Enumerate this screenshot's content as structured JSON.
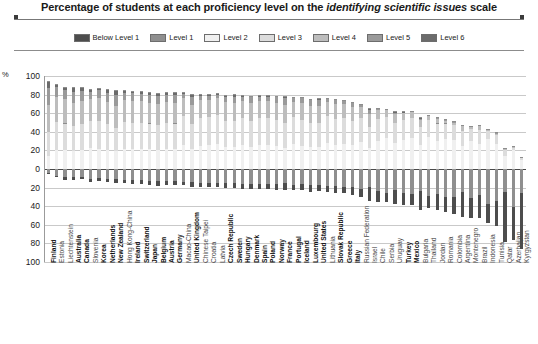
{
  "title": {
    "pre": "Percentage of students at each proficiency level on the ",
    "italic": "identifying scientific issues",
    "post": " scale"
  },
  "legend": {
    "items": [
      {
        "label": "Below Level 1",
        "color": "#4d4d4d"
      },
      {
        "label": "Level 1",
        "color": "#8f8f8f"
      },
      {
        "label": "Level 2",
        "color": "#f0f0f0"
      },
      {
        "label": "Level 3",
        "color": "#dcdcdc"
      },
      {
        "label": "Level 4",
        "color": "#bdbdbd"
      },
      {
        "label": "Level 5",
        "color": "#9a9a9a"
      },
      {
        "label": "Level 6",
        "color": "#6b6b6b"
      }
    ]
  },
  "axis": {
    "unit": "%",
    "ticks_above": [
      "100",
      "80",
      "60",
      "40",
      "20",
      "0"
    ],
    "ticks_below": [
      "20",
      "40",
      "60",
      "80",
      "100"
    ]
  },
  "chart_data": {
    "type": "bar",
    "title": "Percentage of students at each proficiency level on the identifying scientific issues scale",
    "xlabel": "",
    "ylabel": "%",
    "ylim": [
      -100,
      100
    ],
    "grid": true,
    "legend_position": "top-center",
    "stacked": true,
    "orientation": "vertical-diverging",
    "note": "Levels 2-6 stack upward from zero; Below Level 1 and Level 1 stack downward from zero.",
    "series": [
      {
        "name": "Below Level 1",
        "color": "#4d4d4d",
        "direction": "down"
      },
      {
        "name": "Level 1",
        "color": "#8f8f8f",
        "direction": "down"
      },
      {
        "name": "Level 2",
        "color": "#f0f0f0",
        "direction": "up"
      },
      {
        "name": "Level 3",
        "color": "#dcdcdc",
        "direction": "up"
      },
      {
        "name": "Level 4",
        "color": "#bdbdbd",
        "direction": "up"
      },
      {
        "name": "Level 5",
        "color": "#9a9a9a",
        "direction": "up"
      },
      {
        "name": "Level 6",
        "color": "#6b6b6b",
        "direction": "up"
      }
    ],
    "categories": [
      "Finland",
      "Estonia",
      "Liechtenstein",
      "Australia",
      "Canada",
      "Slovenia",
      "Korea",
      "Netherlands",
      "New Zealand",
      "Hong Kong-China",
      "Ireland",
      "Switzerland",
      "Japan",
      "Belgium",
      "Austria",
      "Germany",
      "Macao-China",
      "United Kingdom",
      "Chinese Taipei",
      "Croatia",
      "Latvia",
      "Czech Republic",
      "Sweden",
      "Hungary",
      "Denmark",
      "Spain",
      "Poland",
      "Norway",
      "France",
      "Portugal",
      "Iceland",
      "Luxembourg",
      "United States",
      "Lithuania",
      "Slovak Republic",
      "Greece",
      "Italy",
      "Russian Federation",
      "Israel",
      "Chile",
      "Serbia",
      "Uruguay",
      "Turkey",
      "Mexico",
      "Bulgaria",
      "Thailand",
      "Jordan",
      "Romania",
      "Colombia",
      "Argentina",
      "Montenegro",
      "Brazil",
      "Indonesia",
      "Tunisia",
      "Qatar",
      "Azerbaijan",
      "Kyrgyzstan"
    ],
    "bold_categories": [
      "Finland",
      "Australia",
      "Canada",
      "Korea",
      "Netherlands",
      "New Zealand",
      "Ireland",
      "Switzerland",
      "Japan",
      "Belgium",
      "Austria",
      "Germany",
      "United Kingdom",
      "Czech Republic",
      "Sweden",
      "Hungary",
      "Denmark",
      "Spain",
      "Poland",
      "Norway",
      "France",
      "Portugal",
      "Iceland",
      "Luxembourg",
      "United States",
      "Slovak Republic",
      "Greece",
      "Italy",
      "Turkey",
      "Mexico"
    ],
    "data": [
      {
        "c": "Finland",
        "bl1": 1.3,
        "l1": 4.0,
        "l2": 15.0,
        "l3": 26.0,
        "l4": 29.0,
        "l5": 18.0,
        "l6": 6.7
      },
      {
        "c": "Estonia",
        "bl1": 1.7,
        "l1": 7.0,
        "l2": 21.0,
        "l3": 31.0,
        "l4": 27.0,
        "l5": 10.0,
        "l6": 2.3
      },
      {
        "c": "Liechtenstein",
        "bl1": 2.7,
        "l1": 9.0,
        "l2": 21.0,
        "l3": 29.0,
        "l4": 26.0,
        "l5": 10.0,
        "l6": 2.3
      },
      {
        "c": "Australia",
        "bl1": 3.0,
        "l1": 9.0,
        "l2": 20.0,
        "l3": 27.0,
        "l4": 25.0,
        "l5": 12.0,
        "l6": 4.0
      },
      {
        "c": "Canada",
        "bl1": 2.3,
        "l1": 9.0,
        "l2": 21.0,
        "l3": 28.0,
        "l4": 25.0,
        "l5": 11.0,
        "l6": 3.7
      },
      {
        "c": "Slovenia",
        "bl1": 3.0,
        "l1": 11.0,
        "l2": 24.0,
        "l3": 29.0,
        "l4": 23.0,
        "l5": 8.0,
        "l6": 2.0
      },
      {
        "c": "Korea",
        "bl1": 2.4,
        "l1": 10.0,
        "l2": 23.0,
        "l3": 30.0,
        "l4": 24.0,
        "l5": 9.0,
        "l6": 1.6
      },
      {
        "c": "Netherlands",
        "bl1": 3.1,
        "l1": 11.0,
        "l2": 22.0,
        "l3": 27.0,
        "l4": 24.0,
        "l5": 10.0,
        "l6": 2.9
      },
      {
        "c": "New Zealand",
        "bl1": 4.2,
        "l1": 11.0,
        "l2": 20.0,
        "l3": 25.0,
        "l4": 24.0,
        "l5": 12.0,
        "l6": 3.8
      },
      {
        "c": "Hong Kong-China",
        "bl1": 3.3,
        "l1": 12.0,
        "l2": 23.0,
        "l3": 29.0,
        "l4": 23.0,
        "l5": 8.0,
        "l6": 1.7
      },
      {
        "c": "Ireland",
        "bl1": 3.6,
        "l1": 12.0,
        "l2": 23.0,
        "l3": 28.0,
        "l4": 23.0,
        "l5": 9.0,
        "l6": 1.4
      },
      {
        "c": "Switzerland",
        "bl1": 4.0,
        "l1": 12.0,
        "l2": 23.0,
        "l3": 28.0,
        "l4": 23.0,
        "l5": 8.0,
        "l6": 2.0
      },
      {
        "c": "Japan",
        "bl1": 4.1,
        "l1": 13.0,
        "l2": 23.0,
        "l3": 27.0,
        "l4": 22.0,
        "l5": 9.0,
        "l6": 1.9
      },
      {
        "c": "Belgium",
        "bl1": 5.0,
        "l1": 13.0,
        "l2": 22.0,
        "l3": 26.0,
        "l4": 23.0,
        "l5": 9.0,
        "l6": 2.0
      },
      {
        "c": "Austria",
        "bl1": 4.6,
        "l1": 13.0,
        "l2": 23.0,
        "l3": 28.0,
        "l4": 22.0,
        "l5": 8.0,
        "l6": 1.4
      },
      {
        "c": "Germany",
        "bl1": 4.5,
        "l1": 13.0,
        "l2": 23.0,
        "l3": 27.0,
        "l4": 22.0,
        "l5": 9.0,
        "l6": 1.5
      },
      {
        "c": "Macao-China",
        "bl1": 3.4,
        "l1": 14.0,
        "l2": 27.0,
        "l3": 31.0,
        "l4": 19.0,
        "l5": 5.0,
        "l6": 0.6
      },
      {
        "c": "United Kingdom",
        "bl1": 5.2,
        "l1": 14.0,
        "l2": 23.0,
        "l3": 26.0,
        "l4": 21.0,
        "l5": 9.0,
        "l6": 1.8
      },
      {
        "c": "Chinese Taipei",
        "bl1": 4.1,
        "l1": 15.0,
        "l2": 26.0,
        "l3": 30.0,
        "l4": 19.0,
        "l5": 5.0,
        "l6": 0.9
      },
      {
        "c": "Croatia",
        "bl1": 4.3,
        "l1": 15.0,
        "l2": 27.0,
        "l3": 30.0,
        "l4": 18.0,
        "l5": 5.0,
        "l6": 0.7
      },
      {
        "c": "Latvia",
        "bl1": 4.1,
        "l1": 15.0,
        "l2": 28.0,
        "l3": 31.0,
        "l4": 18.0,
        "l5": 4.0,
        "l6": 0.4
      },
      {
        "c": "Czech Republic",
        "bl1": 5.7,
        "l1": 15.0,
        "l2": 25.0,
        "l3": 28.0,
        "l4": 20.0,
        "l5": 6.0,
        "l6": 1.0
      },
      {
        "c": "Sweden",
        "bl1": 5.6,
        "l1": 15.0,
        "l2": 25.0,
        "l3": 28.0,
        "l4": 19.0,
        "l5": 7.0,
        "l6": 1.3
      },
      {
        "c": "Hungary",
        "bl1": 5.0,
        "l1": 16.0,
        "l2": 27.0,
        "l3": 29.0,
        "l4": 18.0,
        "l5": 5.0,
        "l6": 0.6
      },
      {
        "c": "Denmark",
        "bl1": 6.0,
        "l1": 16.0,
        "l2": 25.0,
        "l3": 28.0,
        "l4": 19.0,
        "l5": 6.0,
        "l6": 1.0
      },
      {
        "c": "Spain",
        "bl1": 5.6,
        "l1": 16.0,
        "l2": 27.0,
        "l3": 29.0,
        "l4": 18.0,
        "l5": 5.0,
        "l6": 0.6
      },
      {
        "c": "Poland",
        "bl1": 5.5,
        "l1": 16.0,
        "l2": 27.0,
        "l3": 29.0,
        "l4": 18.0,
        "l5": 5.0,
        "l6": 0.6
      },
      {
        "c": "Norway",
        "bl1": 6.3,
        "l1": 16.0,
        "l2": 26.0,
        "l3": 28.0,
        "l4": 18.0,
        "l5": 6.0,
        "l6": 0.9
      },
      {
        "c": "France",
        "bl1": 7.1,
        "l1": 15.0,
        "l2": 24.0,
        "l3": 27.0,
        "l4": 19.0,
        "l5": 7.0,
        "l6": 1.3
      },
      {
        "c": "Portugal",
        "bl1": 5.5,
        "l1": 17.0,
        "l2": 28.0,
        "l3": 29.0,
        "l4": 16.0,
        "l5": 4.0,
        "l6": 0.4
      },
      {
        "c": "Iceland",
        "bl1": 7.0,
        "l1": 16.0,
        "l2": 26.0,
        "l3": 28.0,
        "l4": 18.0,
        "l5": 5.0,
        "l6": 0.7
      },
      {
        "c": "Luxembourg",
        "bl1": 7.4,
        "l1": 17.0,
        "l2": 25.0,
        "l3": 26.0,
        "l4": 18.0,
        "l5": 6.0,
        "l6": 0.8
      },
      {
        "c": "United States",
        "bl1": 7.0,
        "l1": 17.0,
        "l2": 25.0,
        "l3": 26.0,
        "l4": 18.0,
        "l5": 6.0,
        "l6": 1.2
      },
      {
        "c": "Lithuania",
        "bl1": 6.5,
        "l1": 18.0,
        "l2": 29.0,
        "l3": 29.0,
        "l4": 15.0,
        "l5": 3.0,
        "l6": 0.3
      },
      {
        "c": "Slovak Republic",
        "bl1": 7.5,
        "l1": 18.0,
        "l2": 27.0,
        "l3": 28.0,
        "l4": 16.0,
        "l5": 4.0,
        "l6": 0.4
      },
      {
        "c": "Greece",
        "bl1": 7.2,
        "l1": 19.0,
        "l2": 28.0,
        "l3": 28.0,
        "l4": 15.0,
        "l5": 3.0,
        "l6": 0.3
      },
      {
        "c": "Italy",
        "bl1": 8.5,
        "l1": 19.0,
        "l2": 27.0,
        "l3": 26.0,
        "l4": 15.0,
        "l5": 4.0,
        "l6": 0.5
      },
      {
        "c": "Russian Federation",
        "bl1": 8.0,
        "l1": 22.0,
        "l2": 30.0,
        "l3": 26.0,
        "l4": 12.0,
        "l5": 2.0,
        "l6": 0.2
      },
      {
        "c": "Israel",
        "bl1": 15.0,
        "l1": 19.0,
        "l2": 24.0,
        "l3": 22.0,
        "l4": 14.0,
        "l5": 5.0,
        "l6": 0.9
      },
      {
        "c": "Chile",
        "bl1": 11.0,
        "l1": 24.0,
        "l2": 31.0,
        "l3": 24.0,
        "l4": 9.0,
        "l5": 1.5,
        "l6": 0.1
      },
      {
        "c": "Serbia",
        "bl1": 10.0,
        "l1": 26.0,
        "l2": 34.0,
        "l3": 23.0,
        "l4": 7.0,
        "l5": 0.8,
        "l6": 0.1
      },
      {
        "c": "Uruguay",
        "bl1": 15.0,
        "l1": 23.0,
        "l2": 29.0,
        "l3": 22.0,
        "l4": 9.0,
        "l5": 1.8,
        "l6": 0.2
      },
      {
        "c": "Turkey",
        "bl1": 13.0,
        "l1": 26.0,
        "l2": 32.0,
        "l3": 22.0,
        "l4": 7.0,
        "l5": 0.9,
        "l6": 0.1
      },
      {
        "c": "Mexico",
        "bl1": 12.0,
        "l1": 27.0,
        "l2": 34.0,
        "l3": 22.0,
        "l4": 6.0,
        "l5": 0.5,
        "l6": 0.1
      },
      {
        "c": "Bulgaria",
        "bl1": 20.0,
        "l1": 24.0,
        "l2": 27.0,
        "l3": 19.0,
        "l4": 8.0,
        "l5": 1.5,
        "l6": 0.2
      },
      {
        "c": "Thailand",
        "bl1": 13.0,
        "l1": 29.0,
        "l2": 35.0,
        "l3": 19.0,
        "l4": 4.0,
        "l5": 0.3,
        "l6": 0.0
      },
      {
        "c": "Jordan",
        "bl1": 17.0,
        "l1": 27.0,
        "l2": 31.0,
        "l3": 19.0,
        "l4": 5.0,
        "l5": 0.7,
        "l6": 0.1
      },
      {
        "c": "Romania",
        "bl1": 16.0,
        "l1": 30.0,
        "l2": 33.0,
        "l3": 17.0,
        "l4": 3.0,
        "l5": 0.3,
        "l6": 0.0
      },
      {
        "c": "Colombia",
        "bl1": 18.0,
        "l1": 30.0,
        "l2": 32.0,
        "l3": 16.0,
        "l4": 3.0,
        "l5": 0.3,
        "l6": 0.0
      },
      {
        "c": "Argentina",
        "bl1": 27.0,
        "l1": 25.0,
        "l2": 26.0,
        "l3": 16.0,
        "l4": 5.0,
        "l5": 0.6,
        "l6": 0.1
      },
      {
        "c": "Montenegro",
        "bl1": 22.0,
        "l1": 31.0,
        "l2": 31.0,
        "l3": 13.0,
        "l4": 2.0,
        "l5": 0.2,
        "l6": 0.0
      },
      {
        "c": "Brazil",
        "bl1": 25.0,
        "l1": 28.0,
        "l2": 28.0,
        "l3": 15.0,
        "l4": 4.0,
        "l5": 0.4,
        "l6": 0.0
      },
      {
        "c": "Indonesia",
        "bl1": 20.0,
        "l1": 38.0,
        "l2": 33.0,
        "l3": 9.0,
        "l4": 0.8,
        "l5": 0.0,
        "l6": 0.0
      },
      {
        "c": "Tunisia",
        "bl1": 27.0,
        "l1": 34.0,
        "l2": 28.0,
        "l3": 10.0,
        "l4": 1.3,
        "l5": 0.1,
        "l6": 0.0
      },
      {
        "c": "Qatar",
        "bl1": 53.0,
        "l1": 25.0,
        "l2": 15.0,
        "l3": 6.0,
        "l4": 1.3,
        "l5": 0.2,
        "l6": 0.0
      },
      {
        "c": "Azerbaijan",
        "bl1": 35.0,
        "l1": 41.0,
        "l2": 21.0,
        "l3": 3.0,
        "l4": 0.2,
        "l5": 0.0,
        "l6": 0.0
      },
      {
        "c": "Kyrgyzstan",
        "bl1": 60.0,
        "l1": 26.0,
        "l2": 11.0,
        "l3": 2.0,
        "l4": 0.2,
        "l5": 0.0,
        "l6": 0.0
      }
    ]
  }
}
